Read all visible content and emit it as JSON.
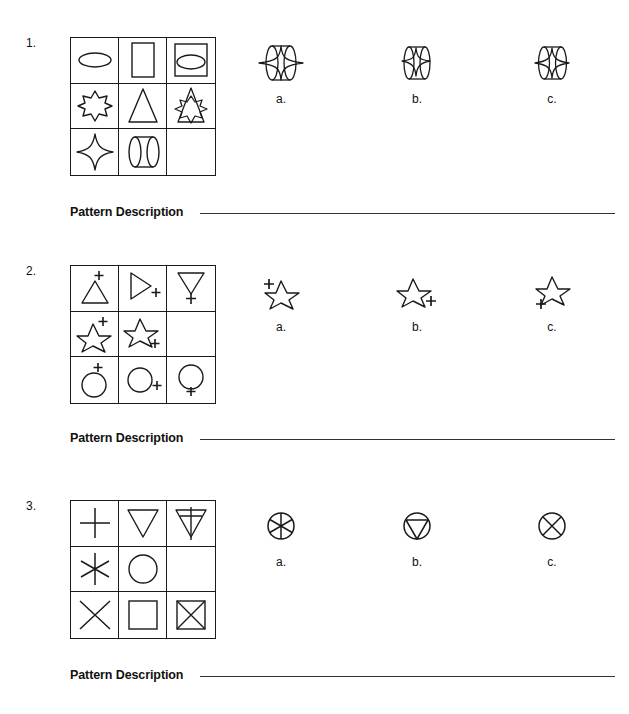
{
  "worksheet": {
    "description_label": "Pattern Description",
    "problems": [
      {
        "number": "1.",
        "matrix": {
          "cells": [
            {
              "name": "cell-r1c1",
              "shapes": "ellipse"
            },
            {
              "name": "cell-r1c2",
              "shapes": "rectangle"
            },
            {
              "name": "cell-r1c3",
              "shapes": "rectangle + ellipse"
            },
            {
              "name": "cell-r2c1",
              "shapes": "eight-point-burst"
            },
            {
              "name": "cell-r2c2",
              "shapes": "triangle"
            },
            {
              "name": "cell-r2c3",
              "shapes": "triangle + eight-point-burst"
            },
            {
              "name": "cell-r3c1",
              "shapes": "four-point-star"
            },
            {
              "name": "cell-r3c2",
              "shapes": "cylinder"
            },
            {
              "name": "cell-r3c3",
              "shapes": "empty"
            }
          ]
        },
        "options": [
          {
            "label": "a.",
            "shapes": "cylinder + four-point-star wide"
          },
          {
            "label": "b.",
            "shapes": "cylinder + four-point-star small"
          },
          {
            "label": "c.",
            "shapes": "cylinder + four-point-star centered"
          }
        ]
      },
      {
        "number": "2.",
        "matrix": {
          "cells": [
            {
              "name": "cell-r1c1",
              "shapes": "triangle with plus top"
            },
            {
              "name": "cell-r1c2",
              "shapes": "right-triangle with plus right"
            },
            {
              "name": "cell-r1c3",
              "shapes": "down-triangle with plus bottom"
            },
            {
              "name": "cell-r2c1",
              "shapes": "five-point-star with plus top"
            },
            {
              "name": "cell-r2c2",
              "shapes": "five-point-star with plus right"
            },
            {
              "name": "cell-r2c3",
              "shapes": "empty"
            },
            {
              "name": "cell-r3c1",
              "shapes": "circle with plus top"
            },
            {
              "name": "cell-r3c2",
              "shapes": "circle with plus right"
            },
            {
              "name": "cell-r3c3",
              "shapes": "circle with plus bottom"
            }
          ]
        },
        "options": [
          {
            "label": "a.",
            "shapes": "five-point-star with plus upper-left"
          },
          {
            "label": "b.",
            "shapes": "five-point-star with plus right"
          },
          {
            "label": "c.",
            "shapes": "five-point-star with plus bottom-left"
          }
        ]
      },
      {
        "number": "3.",
        "matrix": {
          "cells": [
            {
              "name": "cell-r1c1",
              "shapes": "plus"
            },
            {
              "name": "cell-r1c2",
              "shapes": "down-triangle"
            },
            {
              "name": "cell-r1c3",
              "shapes": "down-triangle + plus"
            },
            {
              "name": "cell-r2c1",
              "shapes": "asterisk"
            },
            {
              "name": "cell-r2c2",
              "shapes": "circle"
            },
            {
              "name": "cell-r2c3",
              "shapes": "empty"
            },
            {
              "name": "cell-r3c1",
              "shapes": "x-cross"
            },
            {
              "name": "cell-r3c2",
              "shapes": "square"
            },
            {
              "name": "cell-r3c3",
              "shapes": "square + x-cross"
            }
          ]
        },
        "options": [
          {
            "label": "a.",
            "shapes": "circle + asterisk"
          },
          {
            "label": "b.",
            "shapes": "circle + down-triangle"
          },
          {
            "label": "c.",
            "shapes": "circle + x-cross"
          }
        ]
      }
    ]
  },
  "colors": {
    "ink": "#1a1a1a",
    "rule": "#333333",
    "background": "#ffffff"
  }
}
